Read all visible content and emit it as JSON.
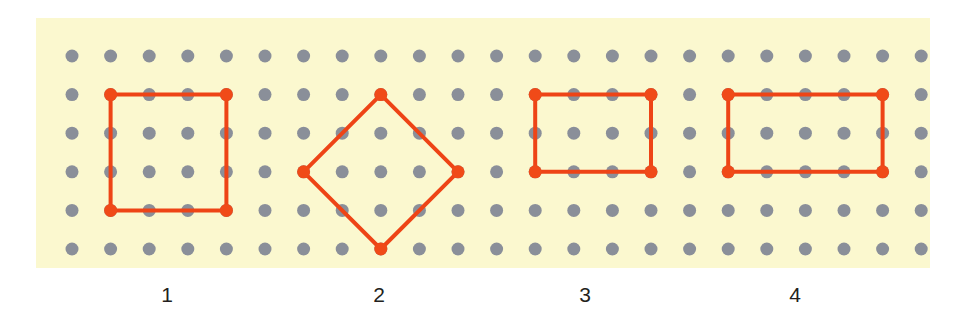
{
  "figure": {
    "background_color": "#ffffff",
    "panel_color": "#fbf8cf",
    "peg_color": "#8a8f99",
    "band_color": "#ee4416",
    "vertex_color": "#f04a18",
    "label_color": "#231f20"
  },
  "grid": {
    "columns": 23,
    "rows": 6,
    "origin_x": 72,
    "origin_y": 56,
    "spacing_x": 38.6,
    "spacing_y": 38.6,
    "peg_radius": 6.5,
    "panel": {
      "left": 36,
      "top": 18,
      "width": 894,
      "height": 250
    }
  },
  "shapes": [
    {
      "id": "shape-1",
      "name": "square",
      "label": "1",
      "label_center_x": 167,
      "stroke_width": 4,
      "vertex_radius": 6.5,
      "vertices": [
        {
          "col": 1,
          "row": 1
        },
        {
          "col": 4,
          "row": 1
        },
        {
          "col": 4,
          "row": 4
        },
        {
          "col": 1,
          "row": 4
        }
      ]
    },
    {
      "id": "shape-2",
      "name": "diamond-rotated-square",
      "label": "2",
      "label_center_x": 379,
      "stroke_width": 4,
      "vertex_radius": 6.5,
      "vertices": [
        {
          "col": 8,
          "row": 1
        },
        {
          "col": 10,
          "row": 3
        },
        {
          "col": 8,
          "row": 5
        },
        {
          "col": 6,
          "row": 3
        }
      ]
    },
    {
      "id": "shape-3",
      "name": "rectangle-small",
      "label": "3",
      "label_center_x": 585,
      "stroke_width": 4,
      "vertex_radius": 6.5,
      "vertices": [
        {
          "col": 12,
          "row": 1
        },
        {
          "col": 15,
          "row": 1
        },
        {
          "col": 15,
          "row": 3
        },
        {
          "col": 12,
          "row": 3
        }
      ]
    },
    {
      "id": "shape-4",
      "name": "rectangle-wide",
      "label": "4",
      "label_center_x": 795,
      "stroke_width": 4,
      "vertex_radius": 6.5,
      "vertices": [
        {
          "col": 17,
          "row": 1
        },
        {
          "col": 21,
          "row": 1
        },
        {
          "col": 21,
          "row": 3
        },
        {
          "col": 17,
          "row": 3
        }
      ]
    }
  ],
  "labels": {
    "y_top": 282,
    "items": [
      {
        "text": "1",
        "center_x": 167
      },
      {
        "text": "2",
        "center_x": 379
      },
      {
        "text": "3",
        "center_x": 585
      },
      {
        "text": "4",
        "center_x": 795
      }
    ]
  }
}
